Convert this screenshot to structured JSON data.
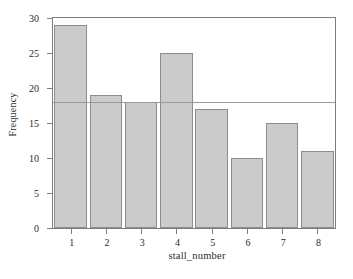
{
  "chart_data": {
    "type": "bar",
    "title": "",
    "subtitle": "",
    "xlabel": "stall_number",
    "ylabel": "Frequency",
    "categories": [
      "1",
      "2",
      "3",
      "4",
      "5",
      "6",
      "7",
      "8"
    ],
    "values": [
      29,
      19,
      18,
      25,
      17,
      10,
      15,
      11
    ],
    "series": [
      {
        "name": "Frequency",
        "values": [
          29,
          19,
          18,
          25,
          17,
          10,
          15,
          11
        ]
      }
    ],
    "xlim": [
      0.5,
      8.5
    ],
    "ylim": [
      0,
      30
    ],
    "yticks": [
      0,
      5,
      10,
      15,
      20,
      25,
      30
    ],
    "ytick_labels": [
      "0",
      "5",
      "10",
      "15",
      "20",
      "25",
      "30"
    ],
    "xticks": [
      1,
      2,
      3,
      4,
      5,
      6,
      7,
      8
    ],
    "xtick_labels": [
      "1",
      "2",
      "3",
      "4",
      "5",
      "6",
      "7",
      "8"
    ],
    "grid": false,
    "legend": null,
    "legend_position": "none",
    "annotations": [
      {
        "name": "expected-frequency-reference-line",
        "type": "hline",
        "value": 18,
        "label": ""
      }
    ],
    "colors": {
      "bar_fill": "#cbcbcb",
      "bar_edge": "#8d8d8d",
      "axis": "#7d7d7d",
      "reference_line": "#9a9a9a",
      "text": "#2b2b2b",
      "background": "#ffffff"
    }
  }
}
